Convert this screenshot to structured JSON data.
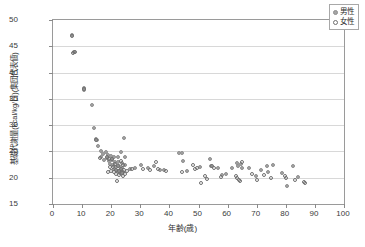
{
  "chart_data": {
    "type": "scatter",
    "title": "",
    "xlabel": "年齢(歳)",
    "ylabel": "基礎代謝量(kcal/kg/日)(集団代表値)",
    "xlim": [
      0,
      100
    ],
    "ylim": [
      15,
      50
    ],
    "xticks": [
      0,
      10,
      20,
      30,
      40,
      50,
      60,
      70,
      80,
      90,
      100
    ],
    "yticks": [
      15,
      20,
      25,
      30,
      35,
      40,
      45,
      50
    ],
    "grid": "horizontal",
    "legend_position": "top-right",
    "colors": {
      "male_marker": "#a5a5a5",
      "female_marker": "#ffffff",
      "marker_edge": "#8e8e8e",
      "gridline": "#d8d8d8",
      "axis": "#9a9a9a",
      "text": "#2e2e2e"
    },
    "series": [
      {
        "name": "男性",
        "marker": "filled-circle",
        "points": [
          [
            6.6,
            47.2
          ],
          [
            7.2,
            44.0
          ],
          [
            7.3,
            43.9
          ],
          [
            10.6,
            37.0
          ],
          [
            10.7,
            36.6
          ],
          [
            13.4,
            33.8
          ],
          [
            14.2,
            29.4
          ],
          [
            14.8,
            27.4
          ],
          [
            15.0,
            27.1
          ],
          [
            15.3,
            26.0
          ],
          [
            16.4,
            25.1
          ],
          [
            16.6,
            24.0
          ],
          [
            17.2,
            24.6
          ],
          [
            17.6,
            23.3
          ],
          [
            18.2,
            24.9
          ],
          [
            18.5,
            23.7
          ],
          [
            19.0,
            24.3
          ],
          [
            19.3,
            23.2
          ],
          [
            19.6,
            22.6
          ],
          [
            20.0,
            24.1
          ],
          [
            20.3,
            23.3
          ],
          [
            20.6,
            22.4
          ],
          [
            20.8,
            21.6
          ],
          [
            21.1,
            23.9
          ],
          [
            21.4,
            22.9
          ],
          [
            21.7,
            22.0
          ],
          [
            21.9,
            21.2
          ],
          [
            22.2,
            24.0
          ],
          [
            22.4,
            23.0
          ],
          [
            22.7,
            22.2
          ],
          [
            22.9,
            21.5
          ],
          [
            23.1,
            20.9
          ],
          [
            23.4,
            24.8
          ],
          [
            23.6,
            22.8
          ],
          [
            23.8,
            21.9
          ],
          [
            24.0,
            21.1
          ],
          [
            24.3,
            27.6
          ],
          [
            24.6,
            23.9
          ],
          [
            24.8,
            22.4
          ],
          [
            26.4,
            21.7
          ],
          [
            28.2,
            21.9
          ],
          [
            30.3,
            22.4
          ],
          [
            32.6,
            21.8
          ],
          [
            34.8,
            22.2
          ],
          [
            36.7,
            21.5
          ],
          [
            38.3,
            21.4
          ],
          [
            43.2,
            24.7
          ],
          [
            44.4,
            24.7
          ],
          [
            44.8,
            23.2
          ],
          [
            46.2,
            21.2
          ],
          [
            50.4,
            22.1
          ],
          [
            53.8,
            23.5
          ],
          [
            54.2,
            22.3
          ],
          [
            56.6,
            21.9
          ],
          [
            58.2,
            20.5
          ],
          [
            59.4,
            20.7
          ],
          [
            61.4,
            21.8
          ],
          [
            63.2,
            22.8
          ],
          [
            63.6,
            22.3
          ],
          [
            64.6,
            22.6
          ],
          [
            65.0,
            21.9
          ],
          [
            67.2,
            21.9
          ],
          [
            69.8,
            20.4
          ],
          [
            71.6,
            21.4
          ],
          [
            73.4,
            22.2
          ],
          [
            73.8,
            21.0
          ],
          [
            75.6,
            22.4
          ],
          [
            78.6,
            20.9
          ],
          [
            80.4,
            18.4
          ],
          [
            82.6,
            22.2
          ],
          [
            84.2,
            20.1
          ]
        ]
      },
      {
        "name": "女性",
        "marker": "open-circle",
        "points": [
          [
            6.4,
            46.9
          ],
          [
            6.8,
            43.7
          ],
          [
            7.4,
            44.0
          ],
          [
            10.5,
            36.8
          ],
          [
            14.9,
            27.2
          ],
          [
            16.0,
            23.8
          ],
          [
            18.4,
            24.0
          ],
          [
            18.8,
            21.1
          ],
          [
            19.2,
            23.6
          ],
          [
            19.5,
            22.0
          ],
          [
            19.8,
            21.2
          ],
          [
            20.2,
            23.5
          ],
          [
            20.5,
            22.1
          ],
          [
            20.9,
            21.0
          ],
          [
            21.2,
            22.6
          ],
          [
            21.5,
            21.4
          ],
          [
            21.8,
            20.8
          ],
          [
            22.0,
            19.3
          ],
          [
            22.3,
            22.3
          ],
          [
            22.6,
            21.3
          ],
          [
            22.8,
            20.6
          ],
          [
            23.2,
            23.1
          ],
          [
            23.5,
            21.7
          ],
          [
            23.7,
            20.9
          ],
          [
            23.9,
            20.4
          ],
          [
            24.2,
            22.5
          ],
          [
            24.5,
            21.4
          ],
          [
            24.9,
            20.7
          ],
          [
            25.4,
            21.3
          ],
          [
            27.1,
            21.6
          ],
          [
            31.0,
            21.6
          ],
          [
            33.4,
            21.5
          ],
          [
            35.4,
            22.9
          ],
          [
            36.2,
            21.7
          ],
          [
            39.0,
            21.3
          ],
          [
            44.2,
            21.0
          ],
          [
            48.2,
            22.4
          ],
          [
            48.8,
            21.6
          ],
          [
            49.4,
            21.9
          ],
          [
            50.8,
            18.9
          ],
          [
            52.4,
            20.3
          ],
          [
            52.9,
            19.7
          ],
          [
            54.6,
            22.2
          ],
          [
            55.2,
            21.9
          ],
          [
            57.8,
            20.2
          ],
          [
            62.8,
            20.4
          ],
          [
            63.4,
            20.0
          ],
          [
            63.8,
            19.6
          ],
          [
            64.2,
            19.4
          ],
          [
            64.8,
            22.9
          ],
          [
            68.4,
            20.8
          ],
          [
            70.2,
            19.5
          ],
          [
            72.6,
            20.6
          ],
          [
            74.8,
            19.9
          ],
          [
            79.6,
            20.3
          ],
          [
            80.2,
            20.0
          ],
          [
            83.0,
            19.5
          ],
          [
            86.2,
            19.1
          ],
          [
            86.6,
            18.9
          ]
        ]
      }
    ]
  },
  "legend": {
    "items": [
      {
        "label": "男性",
        "marker": "filled-circle"
      },
      {
        "label": "女性",
        "marker": "open-circle"
      }
    ]
  }
}
